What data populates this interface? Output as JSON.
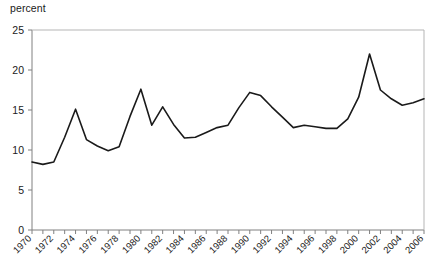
{
  "chart_data": {
    "type": "line",
    "title": "",
    "subtitle": "",
    "xlabel": "",
    "ylabel": "percent",
    "ylim": [
      0,
      25
    ],
    "xlim": [
      1970,
      2006
    ],
    "yticks": [
      0,
      5,
      10,
      15,
      20,
      25
    ],
    "ytick_labels": [
      "0",
      "5",
      "10",
      "15",
      "20",
      "25"
    ],
    "xticks": [
      1970,
      1972,
      1974,
      1976,
      1978,
      1980,
      1982,
      1984,
      1986,
      1988,
      1990,
      1992,
      1994,
      1996,
      1998,
      2000,
      2002,
      2004,
      2006
    ],
    "xtick_labels": [
      "1970",
      "1972",
      "1974",
      "1976",
      "1978",
      "1980",
      "1982",
      "1984",
      "1986",
      "1988",
      "1990",
      "1992",
      "1994",
      "1996",
      "1998",
      "2000",
      "2002",
      "2004",
      "2006"
    ],
    "xtick_rotation": 45,
    "grid": false,
    "legend": false,
    "legend_position": "none",
    "line_color": "#1a1a1a",
    "line_width": 1.6,
    "axis_color": "#808080",
    "background_color": "#ffffff",
    "x": [
      1970,
      1971,
      1972,
      1973,
      1974,
      1975,
      1976,
      1977,
      1978,
      1979,
      1980,
      1981,
      1982,
      1983,
      1984,
      1985,
      1986,
      1987,
      1988,
      1989,
      1990,
      1991,
      1992,
      1993,
      1994,
      1995,
      1996,
      1997,
      1998,
      1999,
      2000,
      2001,
      2002,
      2003,
      2004,
      2005,
      2006
    ],
    "values": [
      8.5,
      8.2,
      8.5,
      11.6,
      15.1,
      11.3,
      10.5,
      9.9,
      10.4,
      14.2,
      17.6,
      13.1,
      15.4,
      13.2,
      11.5,
      11.6,
      12.2,
      12.8,
      13.1,
      15.3,
      17.2,
      16.8,
      15.4,
      14.1,
      12.8,
      13.1,
      12.9,
      12.7,
      12.7,
      13.9,
      16.6,
      22.0,
      17.5,
      16.4,
      15.6,
      15.9,
      16.4
    ]
  },
  "axis": {
    "y_label_text": "percent"
  }
}
